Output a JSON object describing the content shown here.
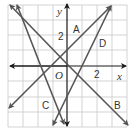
{
  "figure": {
    "axes": {
      "x_label": "x",
      "y_label": "y",
      "origin_label": "O",
      "x_tick_label": "2",
      "y_tick_label": "2",
      "x_range": [
        -4,
        4
      ],
      "y_range": [
        -4,
        4
      ],
      "grid": true
    },
    "lines": [
      {
        "label": "A",
        "equation": "y = x + 1"
      },
      {
        "label": "B",
        "equation": "y = -x"
      },
      {
        "label": "C",
        "equation": "y ≈ -2.5x - 3.5"
      },
      {
        "label": "D",
        "equation": "y = 2x - 2"
      }
    ],
    "colors": {
      "grid": "#c8c8c8",
      "axis": "#1a1a1a",
      "line": "#555555",
      "label": "#333333"
    }
  }
}
